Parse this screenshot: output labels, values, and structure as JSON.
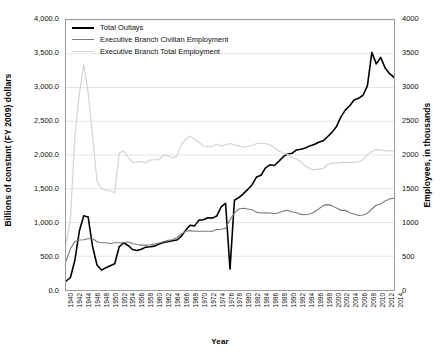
{
  "chart_data": {
    "type": "line",
    "title": "",
    "xlabel": "Year",
    "ylabel": "Billions of constant (FY 2009) dollars",
    "y2label": "Employees, in thousands",
    "ylim": [
      0,
      4000
    ],
    "y2lim": [
      0,
      4000
    ],
    "xlim": [
      1940,
      2014
    ],
    "grid": true,
    "legend_position": "top-left-inside",
    "y_ticks_left": [
      "0.0",
      "500.0",
      "1,000.0",
      "1,500.0",
      "2,000.0",
      "2,500.0",
      "3,000.0",
      "3,500.0",
      "4,000.0"
    ],
    "y_ticks_left_values": [
      0,
      500,
      1000,
      1500,
      2000,
      2500,
      3000,
      3500,
      4000
    ],
    "y_ticks_right": [
      "0",
      "500",
      "1000",
      "1500",
      "2000",
      "2500",
      "3000",
      "3500",
      "4000"
    ],
    "y_ticks_right_values": [
      0,
      500,
      1000,
      1500,
      2000,
      2500,
      3000,
      3500,
      4000
    ],
    "x_tick_labels": [
      "1940",
      "1942",
      "1944",
      "1946",
      "1948",
      "1950",
      "1952",
      "1954",
      "1956",
      "1958",
      "1960",
      "1962",
      "1964",
      "1966",
      "1968",
      "1970",
      "1972",
      "1974",
      "1976",
      "1978",
      "1980",
      "1982",
      "1984",
      "1986",
      "1988",
      "1990",
      "1992",
      "1994",
      "1996",
      "1998",
      "2000",
      "2002",
      "2004",
      "2006",
      "2008",
      "2010",
      "2012",
      "2014"
    ],
    "x": [
      1940,
      1941,
      1942,
      1943,
      1944,
      1945,
      1946,
      1947,
      1948,
      1949,
      1950,
      1951,
      1952,
      1953,
      1954,
      1955,
      1956,
      1957,
      1958,
      1959,
      1960,
      1961,
      1962,
      1963,
      1964,
      1965,
      1966,
      1967,
      1968,
      1969,
      1970,
      1971,
      1972,
      1973,
      1974,
      1975,
      1976,
      1977,
      1978,
      1979,
      1980,
      1981,
      1982,
      1983,
      1984,
      1985,
      1986,
      1987,
      1988,
      1989,
      1990,
      1991,
      1992,
      1993,
      1994,
      1995,
      1996,
      1997,
      1998,
      1999,
      2000,
      2001,
      2002,
      2003,
      2004,
      2005,
      2006,
      2007,
      2008,
      2009,
      2010,
      2011,
      2012,
      2013,
      2014
    ],
    "series": [
      {
        "name": "Total Outlays",
        "color": "#000000",
        "width": 1.6,
        "axis": "left",
        "units": "Billions of constant (FY 2009) dollars",
        "values": [
          130,
          185,
          440,
          870,
          1100,
          1080,
          640,
          370,
          295,
          330,
          360,
          390,
          640,
          700,
          660,
          600,
          585,
          605,
          635,
          640,
          650,
          680,
          705,
          715,
          730,
          740,
          795,
          885,
          960,
          950,
          1035,
          1040,
          1070,
          1065,
          1095,
          1230,
          1285,
          310,
          1330,
          1370,
          1425,
          1490,
          1560,
          1675,
          1700,
          1810,
          1855,
          1845,
          1905,
          1975,
          2015,
          2025,
          2075,
          2085,
          2105,
          2135,
          2155,
          2190,
          2210,
          2270,
          2335,
          2420,
          2560,
          2665,
          2730,
          2815,
          2840,
          2885,
          3025,
          3520,
          3350,
          3445,
          3290,
          3205,
          3150
        ]
      },
      {
        "name": "Executive Branch Civilian Employment",
        "color": "#7a7a7a",
        "width": 1.1,
        "axis": "right",
        "units": "Employees, in thousands",
        "values": [
          430,
          610,
          720,
          740,
          745,
          760,
          760,
          715,
          700,
          700,
          690,
          700,
          700,
          700,
          715,
          690,
          675,
          665,
          665,
          670,
          680,
          695,
          715,
          735,
          745,
          775,
          830,
          870,
          880,
          870,
          870,
          870,
          870,
          870,
          895,
          900,
          915,
          1040,
          1140,
          1200,
          1210,
          1200,
          1190,
          1150,
          1140,
          1145,
          1140,
          1130,
          1145,
          1170,
          1180,
          1155,
          1145,
          1120,
          1115,
          1125,
          1155,
          1200,
          1250,
          1265,
          1250,
          1215,
          1180,
          1180,
          1145,
          1125,
          1105,
          1110,
          1135,
          1200,
          1255,
          1275,
          1320,
          1350,
          1360
        ]
      },
      {
        "name": "Executive Branch Total Employment",
        "color": "#d3d3d3",
        "width": 1.2,
        "axis": "right",
        "units": "Employees, in thousands",
        "values": [
          670,
          1050,
          2270,
          2900,
          3340,
          2920,
          2280,
          1610,
          1500,
          1480,
          1470,
          1440,
          2030,
          2060,
          1970,
          1890,
          1900,
          1905,
          1880,
          1925,
          1930,
          1930,
          2000,
          1990,
          1960,
          1980,
          2150,
          2230,
          2280,
          2230,
          2190,
          2130,
          2125,
          2130,
          2160,
          2135,
          2150,
          2170,
          2150,
          2135,
          2115,
          2130,
          2140,
          2170,
          2170,
          2170,
          2150,
          2110,
          2060,
          2030,
          2010,
          1960,
          1940,
          1900,
          1835,
          1800,
          1780,
          1790,
          1800,
          1860,
          1880,
          1880,
          1890,
          1890,
          1890,
          1890,
          1900,
          1930,
          2000,
          2050,
          2080,
          2080,
          2060,
          2060,
          2060
        ]
      }
    ]
  },
  "axes": {
    "y_left_title": "Billions of constant (FY 2009) dollars",
    "y_right_title": "Employees, in thousands",
    "x_title": "Year"
  },
  "legend": {
    "items": [
      {
        "label": "Total Outlays"
      },
      {
        "label": "Executive Branch Civilian Employment"
      },
      {
        "label": "Executive Branch Total Employment"
      }
    ]
  }
}
